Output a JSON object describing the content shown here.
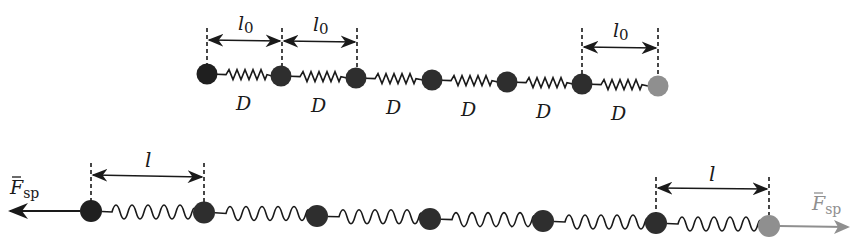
{
  "diagram": {
    "type": "spring-chain",
    "colors": {
      "ball_dark": "#2b2b2b",
      "ball_light": "#8f8f8f",
      "line": "#1a1a1a",
      "force_right": "#8f8f8f"
    },
    "top_chain": {
      "state": "relaxed",
      "ball_count": 7,
      "spring_label": "D",
      "spring_labels": [
        "D",
        "D",
        "D",
        "D",
        "D",
        "D"
      ],
      "length_label": "l",
      "length_subscript": "0",
      "length_annotations": [
        "l0 (balls 1-2)",
        "l0 (balls 2-3)",
        "l0 (balls 6-7)"
      ]
    },
    "bottom_chain": {
      "state": "stretched",
      "ball_count": 7,
      "length_label": "l",
      "length_annotations": [
        "l (balls 1-2)",
        "l (balls 6-7)"
      ],
      "force_label": "F",
      "force_subscript": "sp",
      "forces": [
        "left force on ball 1",
        "right force on ball 7"
      ]
    }
  }
}
